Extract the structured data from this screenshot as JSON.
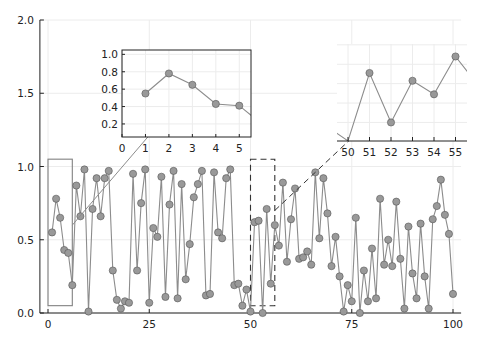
{
  "chart_data": {
    "type": "line",
    "title": "",
    "xlabel": "",
    "ylabel": "",
    "grid": true,
    "legend": "none",
    "main": {
      "xlim": [
        -2,
        102
      ],
      "ylim": [
        0,
        2
      ],
      "xticks": [
        0,
        25,
        50,
        75,
        100
      ],
      "xtick_labels": [
        "0",
        "25",
        "50",
        "75",
        "100"
      ],
      "yticks": [
        0,
        0.5,
        1,
        1.5,
        2
      ],
      "ytick_labels": [
        "0.0",
        "0.5",
        "1.0",
        "1.5",
        "2.0"
      ],
      "x": [
        1,
        2,
        3,
        4,
        5,
        6,
        7,
        8,
        9,
        10,
        11,
        12,
        13,
        14,
        15,
        16,
        17,
        18,
        19,
        20,
        21,
        22,
        23,
        24,
        25,
        26,
        27,
        28,
        29,
        30,
        31,
        32,
        33,
        34,
        35,
        36,
        37,
        38,
        39,
        40,
        41,
        42,
        43,
        44,
        45,
        46,
        47,
        48,
        49,
        50,
        51,
        52,
        53,
        54,
        55,
        56,
        57,
        58,
        59,
        60,
        61,
        62,
        63,
        64,
        65,
        66,
        67,
        68,
        69,
        70,
        71,
        72,
        73,
        74,
        75,
        76,
        77,
        78,
        79,
        80,
        81,
        82,
        83,
        84,
        85,
        86,
        87,
        88,
        89,
        90,
        91,
        92,
        93,
        94,
        95,
        96,
        97,
        98,
        99,
        100
      ],
      "y": [
        0.55,
        0.78,
        0.65,
        0.43,
        0.41,
        0.19,
        0.87,
        0.66,
        0.98,
        0.01,
        0.71,
        0.92,
        0.66,
        0.92,
        0.97,
        0.29,
        0.09,
        0.03,
        0.08,
        0.07,
        0.95,
        0.29,
        0.75,
        0.98,
        0.07,
        0.58,
        0.52,
        0.93,
        0.11,
        0.74,
        0.97,
        0.1,
        0.88,
        0.23,
        0.47,
        0.79,
        0.88,
        0.97,
        0.12,
        0.13,
        0.96,
        0.55,
        0.51,
        0.92,
        0.98,
        0.19,
        0.2,
        0.05,
        0.16,
        0.01,
        0.62,
        0.63,
        0.0,
        0.71,
        0.2,
        0.6,
        0.46,
        0.89,
        0.35,
        0.64,
        0.85,
        0.37,
        0.38,
        0.42,
        0.33,
        0.96,
        0.51,
        0.92,
        0.68,
        0.32,
        0.52,
        0.25,
        0.01,
        0.19,
        0.08,
        0.65,
        0.0,
        0.29,
        0.08,
        0.44,
        0.1,
        0.78,
        0.33,
        0.5,
        0.32,
        0.76,
        0.37,
        0.03,
        0.59,
        0.27,
        0.1,
        0.61,
        0.25,
        0.03,
        0.64,
        0.73,
        0.91,
        0.67,
        0.54,
        0.13
      ],
      "highlight_boxes": [
        {
          "x0": 0,
          "x1": 6,
          "y0": 0.05,
          "y1": 1.05,
          "style": "solid"
        },
        {
          "x0": 50,
          "x1": 56,
          "y0": 0.05,
          "y1": 1.05,
          "style": "dashed"
        }
      ]
    },
    "insets": [
      {
        "name": "inset-1",
        "xlim": [
          0,
          5.5
        ],
        "ylim": [
          0.05,
          1.05
        ],
        "xticks": [
          0,
          1,
          2,
          3,
          4,
          5
        ],
        "xtick_labels": [
          "0",
          "1",
          "2",
          "3",
          "4",
          "5"
        ],
        "yticks": [
          0.2,
          0.4,
          0.6,
          0.8,
          1.0
        ],
        "ytick_labels": [
          "0.2",
          "0.4",
          "0.6",
          "0.8",
          "1.0"
        ],
        "framed": true,
        "x": [
          1,
          2,
          3,
          4,
          5,
          6
        ],
        "y": [
          0.55,
          0.78,
          0.65,
          0.43,
          0.41,
          0.19
        ]
      },
      {
        "name": "inset-2",
        "xlim": [
          49.7,
          55.5
        ],
        "ylim": [
          0.05,
          1.05
        ],
        "xticks": [
          50,
          51,
          52,
          53,
          54,
          55
        ],
        "xtick_labels": [
          "50",
          "51",
          "52",
          "53",
          "54",
          "55"
        ],
        "framed": false,
        "x": [
          49,
          50,
          51,
          52,
          53,
          54,
          55,
          56
        ],
        "y": [
          0.16,
          0.01,
          0.71,
          0.2,
          0.63,
          0.49,
          0.88,
          0.6
        ]
      }
    ]
  },
  "colors": {
    "series": "#8c8c8c",
    "marker_fill": "#999999",
    "marker_edge": "#555555",
    "axis": "#222222",
    "grid": "#ececec",
    "box": "#808080"
  }
}
